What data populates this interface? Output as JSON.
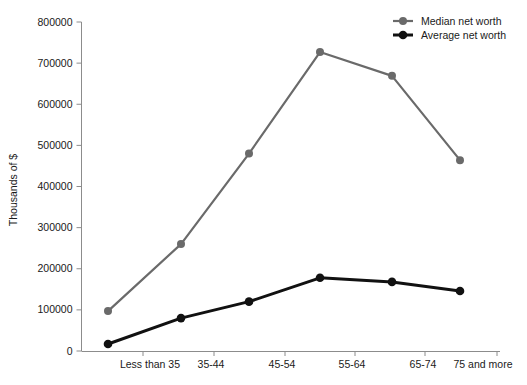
{
  "chart_data": {
    "type": "line",
    "title": "",
    "xlabel": "",
    "ylabel": "Thousands of $",
    "categories": [
      "Less than 35",
      "35-44",
      "45-54",
      "55-64",
      "65-74",
      "75 and more"
    ],
    "ylim": [
      0,
      800000
    ],
    "ytick_values": [
      0,
      100000,
      200000,
      300000,
      400000,
      500000,
      600000,
      700000,
      800000
    ],
    "ytick_labels": [
      "0",
      "100000",
      "200000",
      "300000",
      "400000",
      "500000",
      "600000",
      "700000",
      "800000"
    ],
    "grid": false,
    "legend_position": "top-right",
    "series": [
      {
        "name": "Median net worth",
        "color": "#6a6a6a",
        "values": [
          97000,
          260000,
          480000,
          727000,
          669000,
          464000
        ]
      },
      {
        "name": "Average net worth",
        "color": "#111111",
        "values": [
          17000,
          80000,
          120000,
          178000,
          168000,
          146000
        ]
      }
    ]
  },
  "legend": {
    "items": [
      {
        "label": "Median net worth",
        "color": "#6a6a6a"
      },
      {
        "label": "Average net worth",
        "color": "#111111"
      }
    ]
  },
  "axis": {
    "y_title": "Thousands of $",
    "axis_color": "#8c8c8c"
  }
}
